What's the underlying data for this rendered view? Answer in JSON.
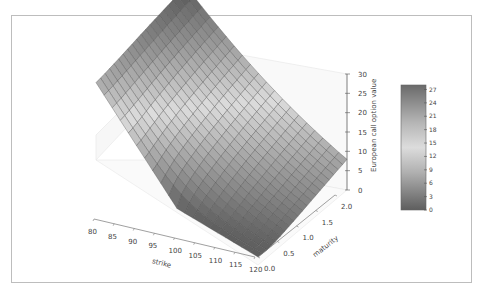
{
  "chart_data": {
    "type": "surface3d",
    "title": "",
    "xlabel": "strike",
    "ylabel": "maturity",
    "zlabel": "European call option value",
    "x_ticks": [
      "80",
      "85",
      "90",
      "95",
      "100",
      "105",
      "110",
      "115",
      "120"
    ],
    "y_ticks": [
      "0.0",
      "0.5",
      "1.0",
      "1.5",
      "2.0"
    ],
    "z_ticks": [
      "0",
      "5",
      "10",
      "15",
      "20",
      "25",
      "30"
    ],
    "x_range": [
      80,
      120
    ],
    "y_range": [
      0.0,
      2.0
    ],
    "z_range": [
      0,
      30
    ],
    "grid_x_count": 21,
    "grid_y_count": 21,
    "model": "Black-Scholes European call, S0=100, r=0.05, sigma=0.2",
    "sample_values": [
      {
        "strike": 80,
        "maturity": 2.0,
        "value": 27.9
      },
      {
        "strike": 80,
        "maturity": 0.0,
        "value": 20.0
      },
      {
        "strike": 100,
        "maturity": 1.0,
        "value": 10.5
      },
      {
        "strike": 120,
        "maturity": 2.0,
        "value": 7.6
      },
      {
        "strike": 120,
        "maturity": 0.0,
        "value": 0.0
      }
    ],
    "colorbar": {
      "ticks": [
        "0",
        "3",
        "6",
        "9",
        "12",
        "15",
        "18",
        "21",
        "24",
        "27"
      ],
      "min": 0,
      "max": 28,
      "colormap": "grey diverging (dark at extremes, light at middle)"
    }
  },
  "colors": {
    "frame_border": "#bdbdbd",
    "axis": "#555555",
    "grid_line": "#444444",
    "pane": "#f4f4f4"
  }
}
